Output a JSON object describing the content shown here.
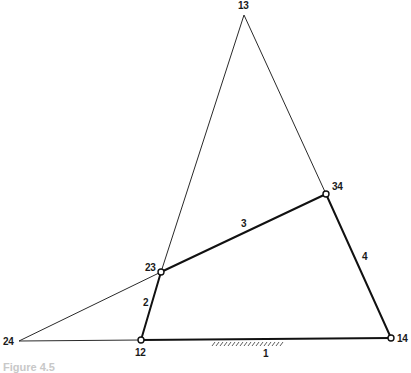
{
  "diagram": {
    "type": "four-bar linkage with instant centers",
    "nodes": [
      {
        "id": "13",
        "x": 244,
        "y": 15,
        "pin": false,
        "label_x": 238,
        "label_y": 1
      },
      {
        "id": "34",
        "x": 326,
        "y": 194,
        "pin": true,
        "label_x": 332,
        "label_y": 182
      },
      {
        "id": "23",
        "x": 161,
        "y": 272,
        "pin": true,
        "label_x": 145,
        "label_y": 263
      },
      {
        "id": "12",
        "x": 141,
        "y": 340,
        "pin": true,
        "label_x": 135,
        "label_y": 348
      },
      {
        "id": "14",
        "x": 391,
        "y": 338,
        "pin": true,
        "label_x": 397,
        "label_y": 334
      },
      {
        "id": "24",
        "x": 19,
        "y": 341,
        "pin": false,
        "label_x": 3,
        "label_y": 337
      }
    ],
    "links": [
      {
        "id": "1",
        "from": "12",
        "to": "14",
        "label_x": 263,
        "label_y": 349,
        "ground": true
      },
      {
        "id": "2",
        "from": "12",
        "to": "23",
        "label_x": 143,
        "label_y": 298
      },
      {
        "id": "3",
        "from": "23",
        "to": "34",
        "label_x": 241,
        "label_y": 219
      },
      {
        "id": "4",
        "from": "34",
        "to": "14",
        "label_x": 362,
        "label_y": 252
      }
    ],
    "construction_lines": [
      {
        "from": "13",
        "to": "23"
      },
      {
        "from": "13",
        "to": "34"
      },
      {
        "from": "24",
        "to": "23"
      },
      {
        "from": "24",
        "to": "12"
      }
    ],
    "labels": {
      "n13": "13",
      "n34": "34",
      "n23": "23",
      "n12": "12",
      "n14": "14",
      "n24": "24",
      "l1": "1",
      "l2": "2",
      "l3": "3",
      "l4": "4"
    },
    "caption": "Figure 4.5"
  }
}
